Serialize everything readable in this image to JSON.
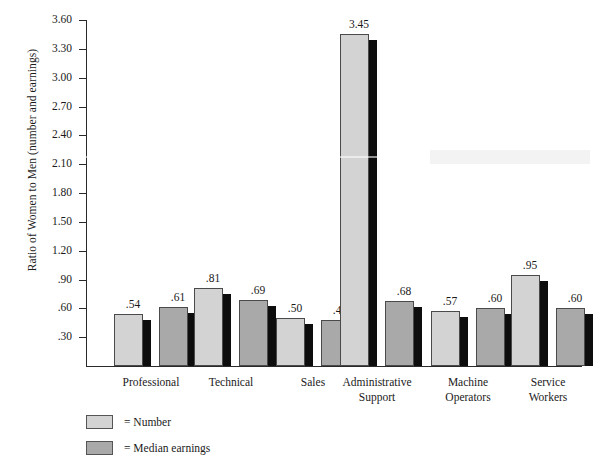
{
  "chart_data": {
    "type": "bar",
    "title": "",
    "xlabel": "",
    "ylabel": "Ratio of Women to Men (number and earnings)",
    "categories": [
      "Professional",
      "Technical",
      "Sales",
      "Administrative Support",
      "Machine Operators",
      "Service Workers"
    ],
    "series": [
      {
        "name": "Number",
        "color": "#d3d3d3",
        "values": [
          0.54,
          0.81,
          0.5,
          3.45,
          0.57,
          0.95
        ],
        "labels": [
          ".54",
          ".81",
          ".50",
          "3.45",
          ".57",
          ".95"
        ]
      },
      {
        "name": "Median earnings",
        "color": "#a9a9a9",
        "values": [
          0.61,
          0.69,
          0.48,
          0.68,
          0.6,
          0.6
        ],
        "labels": [
          ".61",
          ".69",
          ".48",
          ".68",
          ".60",
          ".60"
        ]
      }
    ],
    "ylim": [
      0,
      3.6
    ],
    "yticks": [
      0.3,
      0.6,
      0.9,
      1.2,
      1.5,
      1.8,
      2.1,
      2.4,
      2.7,
      3.0,
      3.3,
      3.6
    ],
    "ytick_labels": [
      ".30",
      ".60",
      ".90",
      "1.20",
      "1.50",
      "1.80",
      "2.10",
      "2.40",
      "2.70",
      "3.00",
      "3.30",
      "3.60"
    ],
    "grid": false,
    "legend_position": "below-left"
  },
  "legend": {
    "rows": [
      {
        "equals": "= Number"
      },
      {
        "equals": "= Median earnings"
      }
    ]
  },
  "category_labels": [
    {
      "line1": "Professional",
      "line2": ""
    },
    {
      "line1": "Technical",
      "line2": ""
    },
    {
      "line1": "Sales",
      "line2": ""
    },
    {
      "line1": "Administrative",
      "line2": "Support"
    },
    {
      "line1": "Machine",
      "line2": "Operators"
    },
    {
      "line1": "Service",
      "line2": "Workers"
    }
  ]
}
